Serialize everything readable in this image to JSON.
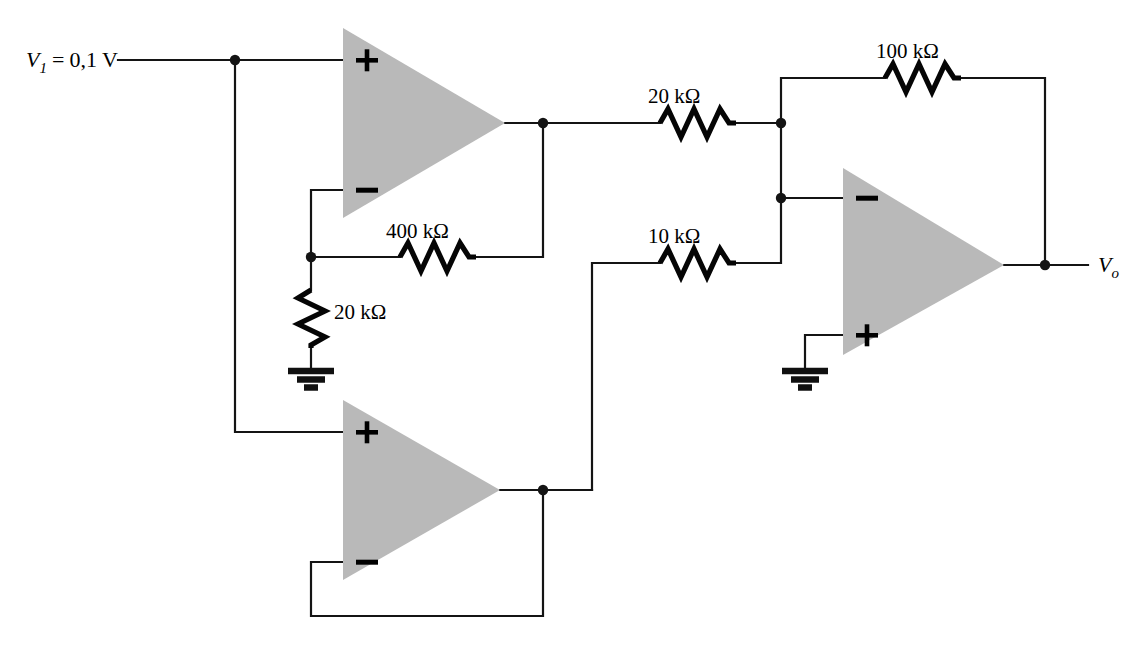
{
  "diagram": {
    "type": "schematic",
    "background_color": "#ffffff",
    "wire_color": "#141414",
    "opamp_fill_color": "#b9b9b9",
    "width": 1138,
    "height": 655
  },
  "labels": {
    "input_source": {
      "symbol": "V",
      "subscript": "1",
      "equals": "=",
      "value": "0,1 V",
      "full_text": "V1 = 0,1 V"
    },
    "output_node": {
      "symbol": "V",
      "subscript": "o",
      "full_text": "Vo"
    }
  },
  "resistors": [
    {
      "id": "r-feedback-400k",
      "label": "400 kΩ",
      "value": 400,
      "unit": "kΩ",
      "orientation": "horizontal"
    },
    {
      "id": "r-gain-20k",
      "label": "20 kΩ",
      "value": 20,
      "unit": "kΩ",
      "orientation": "vertical"
    },
    {
      "id": "r-input-20k",
      "label": "20 kΩ",
      "value": 20,
      "unit": "kΩ",
      "orientation": "horizontal"
    },
    {
      "id": "r-input-10k",
      "label": "10 kΩ",
      "value": 10,
      "unit": "kΩ",
      "orientation": "horizontal"
    },
    {
      "id": "r-feedback-100k",
      "label": "100 kΩ",
      "value": 100,
      "unit": "kΩ",
      "orientation": "horizontal"
    }
  ],
  "opamps": [
    {
      "id": "opamp-top-left",
      "name": "non-inverting-amplifier",
      "plus_label": "+",
      "minus_label": "−",
      "plus_position": "top",
      "minus_position": "bottom"
    },
    {
      "id": "opamp-bottom-left",
      "name": "voltage-follower",
      "plus_label": "+",
      "minus_label": "−",
      "plus_position": "top",
      "minus_position": "bottom"
    },
    {
      "id": "opamp-right",
      "name": "summing-amplifier",
      "plus_label": "+",
      "minus_label": "−",
      "plus_position": "bottom",
      "minus_position": "top"
    }
  ],
  "grounds": [
    {
      "id": "ground-left",
      "name": "ground-symbol"
    },
    {
      "id": "ground-right",
      "name": "ground-symbol"
    }
  ],
  "nodes": [
    {
      "id": "node-input-split"
    },
    {
      "id": "node-inverting-top-left"
    },
    {
      "id": "node-output-top-left"
    },
    {
      "id": "node-summing-top"
    },
    {
      "id": "node-summing-minus"
    },
    {
      "id": "node-output-bottom-left"
    },
    {
      "id": "node-output-right"
    }
  ]
}
